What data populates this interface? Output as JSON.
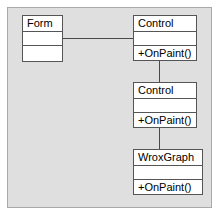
{
  "diagram": {
    "type": "uml-class-diagram",
    "background_color": "#dfdfdf",
    "frame_border_color": "#a9a9a9",
    "box_fill_color": "#ffffff",
    "box_border_color": "#555555",
    "connector_color": "#4a4a4a",
    "classes": [
      {
        "id": "form",
        "name": "Form",
        "attributes": [],
        "operations": [],
        "compartments": 3,
        "x": 22,
        "y": 15,
        "width": 41,
        "height": 47
      },
      {
        "id": "control-top",
        "name": "Control",
        "attributes": [],
        "operations": [
          "+OnPaint()"
        ],
        "compartments": 3,
        "x": 133,
        "y": 15,
        "width": 64,
        "height": 46
      },
      {
        "id": "control-middle",
        "name": "Control",
        "attributes": [],
        "operations": [
          "+OnPaint()"
        ],
        "compartments": 3,
        "x": 133,
        "y": 82,
        "width": 64,
        "height": 46
      },
      {
        "id": "wroxgraph",
        "name": "WroxGraph",
        "attributes": [],
        "operations": [
          "+OnPaint()"
        ],
        "compartments": 3,
        "x": 133,
        "y": 149,
        "width": 70,
        "height": 46
      }
    ],
    "connections": [
      {
        "id": "form-to-control",
        "from": "form",
        "to": "control-top",
        "style": "solid",
        "orientation": "horizontal"
      },
      {
        "id": "control-top-to-control-middle",
        "from": "control-top",
        "to": "control-middle",
        "style": "solid",
        "orientation": "vertical"
      },
      {
        "id": "control-middle-to-wroxgraph",
        "from": "control-middle",
        "to": "wroxgraph",
        "style": "solid",
        "orientation": "vertical"
      }
    ]
  }
}
